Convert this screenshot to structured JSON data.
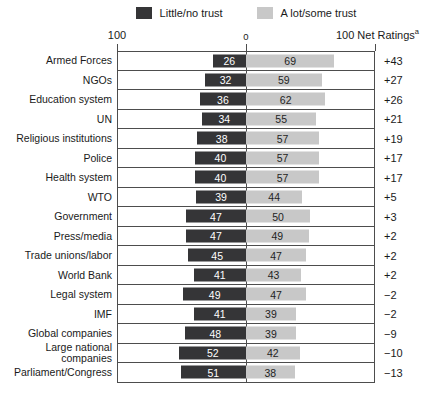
{
  "legend": {
    "little_label": "Little/no trust",
    "alot_label": "A lot/some trust"
  },
  "axis": {
    "left_tick_label": "100",
    "center_tick_label": "0",
    "right_label": "100 Net Ratings",
    "right_label_sup": "a"
  },
  "colors": {
    "dark_bar": "#353537",
    "light_bar": "#c8c8c8",
    "line": "#4d4d4d"
  },
  "chart_data": {
    "type": "bar",
    "orientation": "horizontal-diverging",
    "title": "",
    "xlabel": "",
    "ylabel": "",
    "xlim": [
      -100,
      100
    ],
    "axis_tick_labels": [
      "100",
      "0",
      "100"
    ],
    "net_ratings_header": "Net Ratings(a)",
    "legend": [
      "Little/no trust",
      "A lot/some trust"
    ],
    "legend_position": "top-center",
    "grid": false,
    "categories": [
      "Armed Forces",
      "NGOs",
      "Education system",
      "UN",
      "Religious institutions",
      "Police",
      "Health system",
      "WTO",
      "Government",
      "Press/media",
      "Trade unions/labor",
      "World Bank",
      "Legal system",
      "IMF",
      "Global companies",
      "Large national\ncompanies",
      "Parliament/Congress"
    ],
    "series": [
      {
        "name": "Little/no trust",
        "values": [
          26,
          32,
          36,
          34,
          38,
          40,
          40,
          39,
          47,
          47,
          45,
          41,
          49,
          41,
          48,
          52,
          51
        ]
      },
      {
        "name": "A lot/some trust",
        "values": [
          69,
          59,
          62,
          55,
          57,
          57,
          57,
          44,
          50,
          49,
          47,
          43,
          47,
          39,
          39,
          42,
          38
        ]
      }
    ],
    "net_ratings": [
      "+43",
      "+27",
      "+26",
      "+21",
      "+19",
      "+17",
      "+17",
      "+5",
      "+3",
      "+2",
      "+2",
      "+2",
      "−2",
      "−2",
      "−9",
      "−10",
      "−13"
    ]
  }
}
